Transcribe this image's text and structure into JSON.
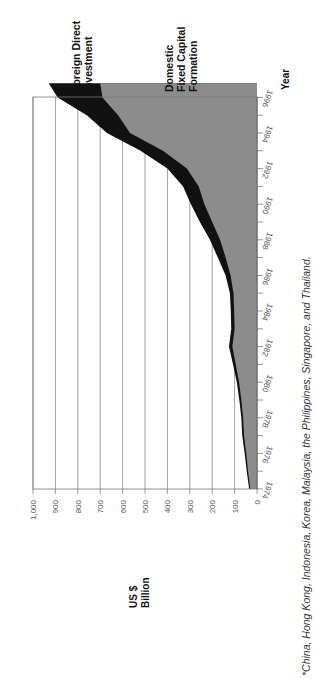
{
  "chart_data": {
    "type": "area",
    "orientation": "rotated-90-clockwise",
    "stacked": true,
    "title": "",
    "xlabel": "Year",
    "ylabel": "US $ Billion",
    "ylim": [
      0,
      1000
    ],
    "y_ticks": [
      "0",
      "100",
      "200",
      "300",
      "400",
      "500",
      "600",
      "700",
      "800",
      "900",
      "1,000"
    ],
    "x_ticks": [
      "1974",
      "1976",
      "1978",
      "1980",
      "1982",
      "1984",
      "1986",
      "1988",
      "1990",
      "1992",
      "1994",
      "1996"
    ],
    "grid": true,
    "x": [
      1974,
      1975,
      1976,
      1977,
      1978,
      1979,
      1980,
      1981,
      1982,
      1983,
      1984,
      1985,
      1986,
      1987,
      1988,
      1989,
      1990,
      1991,
      1992,
      1993,
      1994,
      1995,
      1996,
      1996.8
    ],
    "series": [
      {
        "name": "Domestic Fixed Capital Formation",
        "color": "#8c8c8c",
        "values": [
          30,
          40,
          48,
          58,
          62,
          70,
          80,
          95,
          110,
          100,
          102,
          105,
          118,
          140,
          165,
          200,
          235,
          260,
          313,
          420,
          567,
          620,
          690,
          700
        ]
      },
      {
        "name": "Foreign Direct Investment",
        "color": "#111111",
        "values": [
          5,
          6,
          7,
          8,
          8,
          9,
          10,
          12,
          15,
          15,
          15,
          16,
          22,
          35,
          45,
          55,
          60,
          70,
          87,
          100,
          103,
          140,
          200,
          230
        ]
      }
    ],
    "totals": [
      35,
      46,
      55,
      66,
      70,
      79,
      90,
      107,
      125,
      115,
      117,
      121,
      140,
      175,
      210,
      255,
      295,
      330,
      400,
      520,
      670,
      760,
      890,
      930
    ],
    "legend": [
      "Foreign Direct Investment",
      "Domestic Fixed Capital Formation"
    ],
    "legend_position": "direct labels at end of series",
    "footnote": "*China, Hong Kong, Indonesia, Korea, Malaysia, the Philippines, Singapore, and Thailand."
  },
  "labels": {
    "fdi": "Foreign Direct",
    "fdi2": "Investment",
    "dfcf": "Domestic",
    "dfcf2": "Fixed Capital",
    "dfcf3": "Formation",
    "year": "Year",
    "unit1": "US $",
    "unit2": "Billion",
    "footnote": "*China, Hong Kong, Indonesia, Korea, Malaysia, the Philippines, Singapore, and Thailand."
  }
}
